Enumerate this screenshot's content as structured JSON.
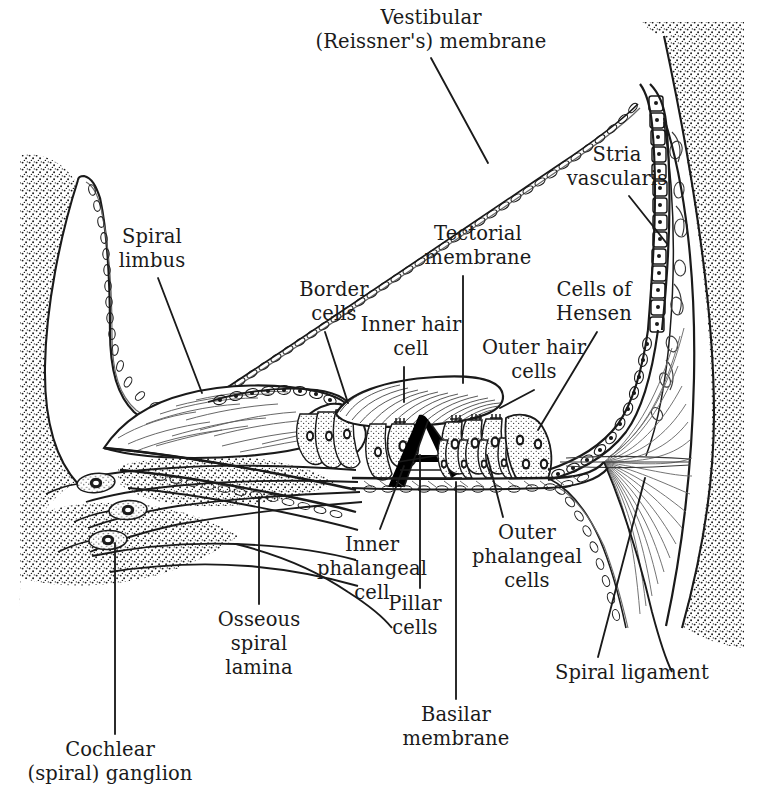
{
  "figure": {
    "type": "anatomical-line-diagram",
    "background_color": "#ffffff",
    "ink_color": "#1a1a1a"
  },
  "labels": [
    {
      "id": "vestibular-membrane",
      "text": "Vestibular\n(Reissner's) membrane",
      "line1": "Vestibular",
      "line2": "(Reissner's) membrane",
      "x": 431,
      "y": 6,
      "align": "ctr",
      "leader": {
        "x1": 431,
        "y1": 58,
        "x2": 488,
        "y2": 163
      }
    },
    {
      "id": "stria-vascularis",
      "text": "Stria\nvascularis",
      "line1": "Stria",
      "line2": "vascularis",
      "x": 617,
      "y": 143,
      "align": "ctr",
      "leader": {
        "x1": 629,
        "y1": 196,
        "x2": 668,
        "y2": 245
      }
    },
    {
      "id": "spiral-limbus",
      "text": "Spiral\nlimbus",
      "line1": "Spiral",
      "line2": "limbus",
      "x": 152,
      "y": 225,
      "align": "ctr",
      "leader": {
        "x1": 158,
        "y1": 278,
        "x2": 202,
        "y2": 393
      }
    },
    {
      "id": "tectorial-membrane",
      "text": "Tectorial\nmembrane",
      "line1": "Tectorial",
      "line2": "membrane",
      "x": 478,
      "y": 222,
      "align": "ctr",
      "leader": {
        "x1": 463,
        "y1": 276,
        "x2": 463,
        "y2": 383
      }
    },
    {
      "id": "border-cells",
      "text": "Border\ncells",
      "line1": "Border",
      "line2": "cells",
      "x": 334,
      "y": 278,
      "align": "ctr",
      "leader": {
        "x1": 325,
        "y1": 332,
        "x2": 348,
        "y2": 403
      }
    },
    {
      "id": "cells-of-hensen",
      "text": "Cells of\nHensen",
      "line1": "Cells of",
      "line2": "Hensen",
      "x": 594,
      "y": 278,
      "align": "ctr",
      "leader": {
        "x1": 597,
        "y1": 332,
        "x2": 538,
        "y2": 430
      }
    },
    {
      "id": "inner-hair-cell",
      "text": "Inner hair\ncell",
      "line1": "Inner hair",
      "line2": "cell",
      "x": 411,
      "y": 313,
      "align": "ctr",
      "leader": {
        "x1": 404,
        "y1": 367,
        "x2": 404,
        "y2": 402
      }
    },
    {
      "id": "outer-hair-cells",
      "text": "Outer hair\ncells",
      "line1": "Outer hair",
      "line2": "cells",
      "x": 534,
      "y": 336,
      "align": "ctr",
      "leader": {
        "x1": 534,
        "y1": 390,
        "x2": 500,
        "y2": 408
      }
    },
    {
      "id": "inner-phalangeal-cell",
      "text": "Inner\nphalangeal\ncell",
      "line1": "Inner",
      "line2": "phalangeal",
      "line3": "cell",
      "x": 372,
      "y": 533,
      "align": "ctr",
      "leader": {
        "x1": 380,
        "y1": 529,
        "x2": 404,
        "y2": 466
      }
    },
    {
      "id": "outer-phalangeal-cells",
      "text": "Outer\nphalangeal\ncells",
      "line1": "Outer",
      "line2": "phalangeal",
      "line3": "cells",
      "x": 527,
      "y": 521,
      "align": "ctr",
      "leader": {
        "x1": 503,
        "y1": 517,
        "x2": 487,
        "y2": 455
      }
    },
    {
      "id": "osseous-spiral-lamina",
      "text": "Osseous\nspiral\nlamina",
      "line1": "Osseous",
      "line2": "spiral",
      "line3": "lamina",
      "x": 259,
      "y": 608,
      "align": "ctr",
      "leader": {
        "x1": 259,
        "y1": 604,
        "x2": 259,
        "y2": 497
      }
    },
    {
      "id": "pillar-cells",
      "text": "Pillar\ncells",
      "line1": "Pillar",
      "line2": "cells",
      "x": 415,
      "y": 592,
      "align": "ctr",
      "leader": {
        "x1": 420,
        "y1": 588,
        "x2": 420,
        "y2": 455
      }
    },
    {
      "id": "spiral-ligament",
      "text": "Spiral ligament",
      "line1": "Spiral ligament",
      "x": 555,
      "y": 661,
      "align": "lft",
      "leader": {
        "x1": 598,
        "y1": 657,
        "x2": 645,
        "y2": 478
      }
    },
    {
      "id": "basilar-membrane",
      "text": "Basilar\nmembrane",
      "line1": "Basilar",
      "line2": "membrane",
      "x": 456,
      "y": 703,
      "align": "ctr",
      "leader": {
        "x1": 456,
        "y1": 699,
        "x2": 456,
        "y2": 482
      }
    },
    {
      "id": "cochlear-spiral-ganglion",
      "text": "Cochlear\n(spiral) ganglion",
      "line1": "Cochlear",
      "line2": "(spiral) ganglion",
      "x": 110,
      "y": 738,
      "align": "ctr",
      "leader": {
        "x1": 115,
        "y1": 734,
        "x2": 115,
        "y2": 543
      }
    }
  ],
  "structures": [
    {
      "id": "temporal-bone-left",
      "name": "Left bone (stippled)"
    },
    {
      "id": "temporal-bone-right",
      "name": "Right bone (stippled)"
    },
    {
      "id": "scala-vestibuli",
      "name": "Scala vestibuli space"
    },
    {
      "id": "scala-media",
      "name": "Cochlear duct / scala media"
    },
    {
      "id": "scala-tympani",
      "name": "Scala tympani space"
    },
    {
      "id": "reissners-membrane",
      "name": "Reissner's membrane beaded line"
    },
    {
      "id": "spiral-limbus-body",
      "name": "Spiral limbus hatched wedge"
    },
    {
      "id": "tectorial-membrane-body",
      "name": "Tectorial membrane striated wedge"
    },
    {
      "id": "tunnel-of-corti",
      "name": "Tunnel of Corti (black pillar cells)"
    },
    {
      "id": "basilar-membrane-body",
      "name": "Basilar membrane"
    },
    {
      "id": "stria-vascularis-body",
      "name": "Stria vascularis cellular strip"
    },
    {
      "id": "spiral-ligament-body",
      "name": "Spiral ligament fibrous fan"
    },
    {
      "id": "spiral-ganglion-neurons",
      "name": "Spiral ganglion bipolar neurons"
    },
    {
      "id": "cochlear-nerve-fibers",
      "name": "Cochlear nerve fiber bundles"
    }
  ]
}
